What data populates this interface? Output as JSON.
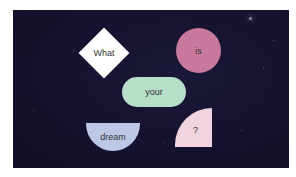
{
  "diagram": {
    "background_color": "#14122e",
    "text_color": "#333333",
    "shapes": [
      {
        "id": "diamond",
        "label": "What",
        "shape": "diamond",
        "color": "#ffffff"
      },
      {
        "id": "circle",
        "label": "is",
        "shape": "circle",
        "color": "#c97a9c"
      },
      {
        "id": "pill",
        "label": "your",
        "shape": "rounded-rectangle",
        "color": "#b6dec8"
      },
      {
        "id": "half",
        "label": "dream",
        "shape": "half-circle",
        "color": "#bcc8e6"
      },
      {
        "id": "quarter",
        "label": "?",
        "shape": "quarter-circle",
        "color": "#f2d4e0"
      }
    ]
  }
}
